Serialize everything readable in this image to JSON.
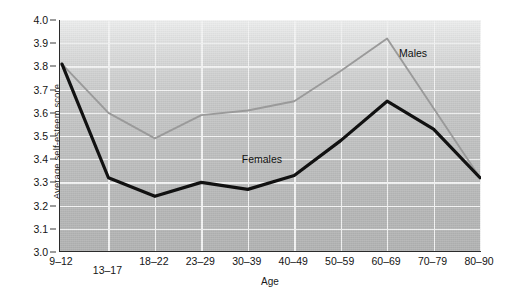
{
  "chart_data": {
    "type": "line",
    "title": "",
    "xlabel": "Age",
    "ylabel": "Average self-esteem score",
    "categories": [
      "9–12",
      "13–17",
      "18–22",
      "23–29",
      "30–39",
      "40–49",
      "50–59",
      "60–69",
      "70–79",
      "80–90"
    ],
    "ylim": [
      3.0,
      4.0
    ],
    "ytick_labels": [
      "3.0",
      "3.1",
      "3.2",
      "3.3",
      "3.4",
      "3.5",
      "3.6",
      "3.7",
      "3.8",
      "3.9",
      "4.0"
    ],
    "ytick_values": [
      3.0,
      3.1,
      3.2,
      3.3,
      3.4,
      3.5,
      3.6,
      3.7,
      3.8,
      3.9,
      4.0
    ],
    "grid": true,
    "legend": "inline-annotations",
    "series": [
      {
        "name": "Males",
        "color": "#9a9a9a",
        "values": [
          3.81,
          3.6,
          3.49,
          3.59,
          3.61,
          3.65,
          3.78,
          3.92,
          3.62,
          3.32
        ],
        "annotation": "Males"
      },
      {
        "name": "Females",
        "color": "#111111",
        "values": [
          3.81,
          3.32,
          3.24,
          3.3,
          3.27,
          3.33,
          3.48,
          3.65,
          3.53,
          3.32
        ],
        "annotation": "Females"
      }
    ]
  },
  "annotations": {
    "males_label": "Males",
    "females_label": "Females"
  }
}
